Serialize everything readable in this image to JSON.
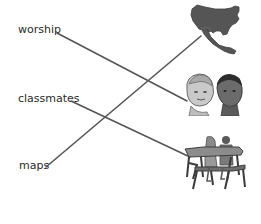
{
  "words": [
    {
      "label": "worship",
      "x": 18,
      "y": 22
    },
    {
      "label": "classmates",
      "x": 18,
      "y": 92
    },
    {
      "label": "maps",
      "x": 19,
      "y": 158
    }
  ],
  "pictures": [
    {
      "name": "north-america-map-picture"
    },
    {
      "name": "two-children-picture"
    },
    {
      "name": "students-at-desk-picture"
    }
  ],
  "connections": [
    {
      "from": "worship",
      "to": "two-children-picture"
    },
    {
      "from": "classmates",
      "to": "students-at-desk-picture"
    },
    {
      "from": "maps",
      "to": "north-america-map-picture"
    }
  ],
  "colors": {
    "line": "#555555",
    "text": "#2a2a2a",
    "picture_dark": "#4a4a4a",
    "picture_mid": "#777777",
    "picture_light": "#b5b5b5"
  }
}
